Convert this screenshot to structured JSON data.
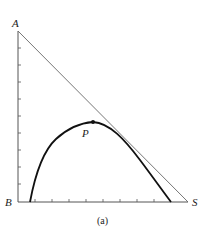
{
  "figure": {
    "caption": "(a)",
    "labels": {
      "top_left": "A",
      "bottom_left": "B",
      "bottom_right": "S",
      "point": "P"
    },
    "colors": {
      "axis": "#555555",
      "hypotenuse": "#666666",
      "curve": "#111111",
      "text": "#222222"
    },
    "geometry": {
      "origin": [
        18,
        202
      ],
      "top": [
        18,
        31
      ],
      "right_end": [
        188,
        202
      ],
      "y_ticks": [
        48,
        65,
        82,
        99,
        116,
        133,
        150,
        167,
        184
      ],
      "x_ticks": [
        35,
        52,
        69,
        86,
        103,
        120,
        137,
        154
      ],
      "curve_path": "M30,202 C36,170 44,150 56,139 C68,128 80,123 93,122 C110,123 125,140 140,160 C152,176 162,190 171,202",
      "point_P": [
        93,
        122
      ]
    }
  }
}
